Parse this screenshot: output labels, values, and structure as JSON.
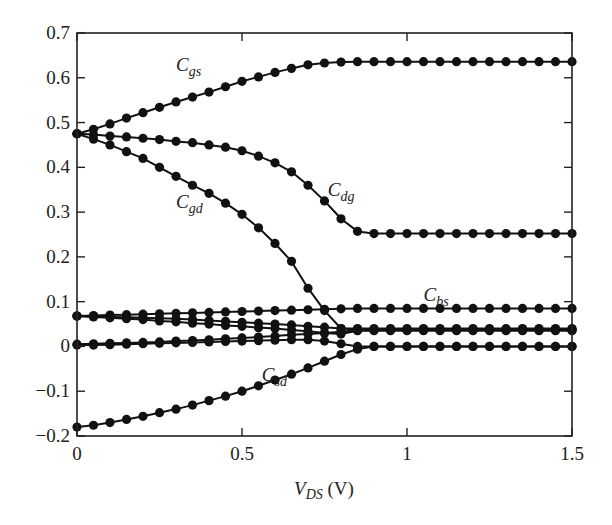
{
  "chart_data": {
    "type": "line",
    "title": "",
    "xlabel": "V_DS (V)",
    "xlabel_main": "V",
    "xlabel_sub": "DS",
    "xlabel_unit": " (V)",
    "ylabel": "",
    "xlim": [
      0,
      1.5
    ],
    "ylim": [
      -0.2,
      0.7
    ],
    "grid": false,
    "legend": "none (inline curve labels)",
    "x_ticks": [
      0,
      0.5,
      1,
      1.5
    ],
    "x_tick_labels": [
      "0",
      "0.5",
      "1",
      "1.5"
    ],
    "y_ticks": [
      -0.2,
      -0.1,
      0,
      0.1,
      0.2,
      0.3,
      0.4,
      0.5,
      0.6,
      0.7
    ],
    "y_tick_labels": [
      "−0.2",
      "−0.1",
      "0",
      "0.1",
      "0.2",
      "0.3",
      "0.4",
      "0.5",
      "0.6",
      "0.7"
    ],
    "x": [
      0,
      0.05,
      0.1,
      0.15,
      0.2,
      0.25,
      0.3,
      0.35,
      0.4,
      0.45,
      0.5,
      0.55,
      0.6,
      0.65,
      0.7,
      0.75,
      0.8,
      0.85,
      0.9,
      0.95,
      1.0,
      1.05,
      1.1,
      1.15,
      1.2,
      1.25,
      1.3,
      1.35,
      1.4,
      1.45,
      1.5
    ],
    "series": [
      {
        "name": "C_gs",
        "label_main": "C",
        "label_sub": "gs",
        "label_pos": [
          0.3,
          0.615
        ],
        "values": [
          0.475,
          0.485,
          0.497,
          0.51,
          0.522,
          0.534,
          0.546,
          0.557,
          0.568,
          0.58,
          0.592,
          0.602,
          0.612,
          0.621,
          0.629,
          0.633,
          0.635,
          0.636,
          0.636,
          0.636,
          0.636,
          0.636,
          0.636,
          0.636,
          0.636,
          0.636,
          0.636,
          0.636,
          0.636,
          0.636,
          0.636
        ]
      },
      {
        "name": "C_dg",
        "label_main": "C",
        "label_sub": "dg",
        "label_pos": [
          0.76,
          0.335
        ],
        "values": [
          0.475,
          0.473,
          0.47,
          0.468,
          0.465,
          0.462,
          0.458,
          0.455,
          0.45,
          0.445,
          0.437,
          0.425,
          0.41,
          0.39,
          0.36,
          0.325,
          0.285,
          0.257,
          0.252,
          0.252,
          0.252,
          0.252,
          0.252,
          0.252,
          0.252,
          0.252,
          0.252,
          0.252,
          0.252,
          0.252,
          0.252
        ]
      },
      {
        "name": "C_gd",
        "label_main": "C",
        "label_sub": "gd",
        "label_pos": [
          0.3,
          0.31
        ],
        "values": [
          0.475,
          0.463,
          0.45,
          0.435,
          0.42,
          0.4,
          0.38,
          0.36,
          0.342,
          0.32,
          0.295,
          0.265,
          0.23,
          0.19,
          0.13,
          0.08,
          0.04,
          0.038,
          0.038,
          0.038,
          0.038,
          0.038,
          0.038,
          0.038,
          0.038,
          0.038,
          0.038,
          0.038,
          0.038,
          0.038,
          0.038
        ]
      },
      {
        "name": "C_bs",
        "label_main": "C",
        "label_sub": "bs",
        "label_pos": [
          1.05,
          0.102
        ],
        "values": [
          0.068,
          0.069,
          0.07,
          0.071,
          0.072,
          0.073,
          0.074,
          0.075,
          0.076,
          0.077,
          0.078,
          0.079,
          0.08,
          0.081,
          0.082,
          0.083,
          0.084,
          0.085,
          0.085,
          0.085,
          0.085,
          0.085,
          0.085,
          0.085,
          0.085,
          0.085,
          0.085,
          0.085,
          0.085,
          0.085,
          0.085
        ]
      },
      {
        "name": "C_bd",
        "label_main": "",
        "label_sub": "",
        "values": [
          0.068,
          0.067,
          0.066,
          0.065,
          0.064,
          0.063,
          0.062,
          0.06,
          0.058,
          0.056,
          0.054,
          0.052,
          0.05,
          0.048,
          0.045,
          0.043,
          0.04,
          0.04,
          0.04,
          0.04,
          0.04,
          0.04,
          0.04,
          0.04,
          0.04,
          0.04,
          0.04,
          0.04,
          0.04,
          0.04,
          0.04
        ]
      },
      {
        "name": "C_bg",
        "label_main": "",
        "label_sub": "",
        "values": [
          0.068,
          0.066,
          0.064,
          0.062,
          0.06,
          0.057,
          0.055,
          0.052,
          0.05,
          0.047,
          0.045,
          0.042,
          0.04,
          0.037,
          0.034,
          0.03,
          0.028,
          0.035,
          0.035,
          0.035,
          0.035,
          0.035,
          0.035,
          0.035,
          0.035,
          0.035,
          0.035,
          0.035,
          0.035,
          0.035,
          0.035
        ]
      },
      {
        "name": "C_ds",
        "label_main": "",
        "label_sub": "",
        "values": [
          0.005,
          0.006,
          0.007,
          0.008,
          0.009,
          0.01,
          0.012,
          0.013,
          0.015,
          0.017,
          0.019,
          0.021,
          0.023,
          0.026,
          0.028,
          0.03,
          0.033,
          0.036,
          0.037,
          0.037,
          0.037,
          0.037,
          0.037,
          0.037,
          0.037,
          0.037,
          0.037,
          0.037,
          0.037,
          0.037,
          0.037
        ]
      },
      {
        "name": "C_sb",
        "label_main": "",
        "label_sub": "",
        "values": [
          0.003,
          0.003,
          0.004,
          0.005,
          0.006,
          0.007,
          0.008,
          0.009,
          0.01,
          0.011,
          0.012,
          0.013,
          0.014,
          0.015,
          0.015,
          0.012,
          0.006,
          0.0,
          0.0,
          0.0,
          0.0,
          0.0,
          0.0,
          0.0,
          0.0,
          0.0,
          0.0,
          0.0,
          0.0,
          0.0,
          0.0
        ]
      },
      {
        "name": "C_sd",
        "label_main": "C",
        "label_sub": "sd",
        "label_pos": [
          0.56,
          -0.078
        ],
        "values": [
          -0.18,
          -0.176,
          -0.17,
          -0.163,
          -0.156,
          -0.148,
          -0.14,
          -0.131,
          -0.121,
          -0.111,
          -0.1,
          -0.088,
          -0.075,
          -0.062,
          -0.048,
          -0.033,
          -0.018,
          -0.006,
          0.0,
          0.0,
          0.0,
          0.0,
          0.0,
          0.0,
          0.0,
          0.0,
          0.0,
          0.0,
          0.0,
          0.0,
          0.0
        ]
      }
    ]
  },
  "colors": {
    "ink": "#111111",
    "background": "#ffffff"
  }
}
